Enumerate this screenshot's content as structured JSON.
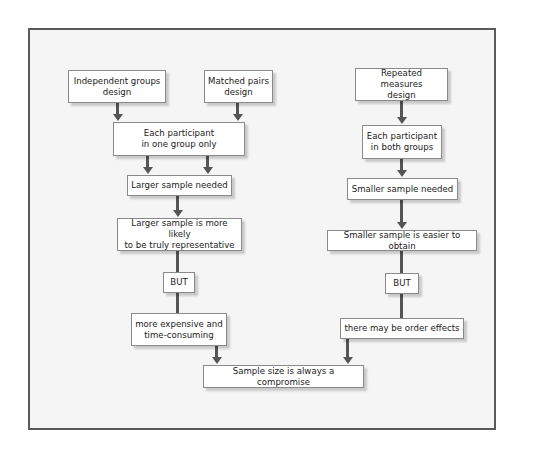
{
  "diagram": {
    "type": "flowchart",
    "title": "",
    "nodes": [
      {
        "id": "independent",
        "label": "Independent groups\ndesign"
      },
      {
        "id": "matched",
        "label": "Matched pairs\ndesign"
      },
      {
        "id": "repeated",
        "label": "Repeated measures\ndesign"
      },
      {
        "id": "one_group",
        "label": "Each participant\nin one group only"
      },
      {
        "id": "both_groups",
        "label": "Each participant\nin both groups"
      },
      {
        "id": "larger_needed",
        "label": "Larger sample needed"
      },
      {
        "id": "smaller_needed",
        "label": "Smaller sample needed"
      },
      {
        "id": "larger_representative",
        "label": "Larger sample is more likely\nto be truly representative"
      },
      {
        "id": "smaller_easier",
        "label": "Smaller sample is easier to obtain"
      },
      {
        "id": "but_left",
        "label": "BUT"
      },
      {
        "id": "but_right",
        "label": "BUT"
      },
      {
        "id": "expensive",
        "label": "more expensive and\ntime-consuming"
      },
      {
        "id": "order_effects",
        "label": "there may be order effects"
      },
      {
        "id": "compromise",
        "label": "Sample size is always a compromise"
      }
    ],
    "edges": [
      {
        "from": "independent",
        "to": "one_group"
      },
      {
        "from": "matched",
        "to": "one_group"
      },
      {
        "from": "one_group",
        "to": "larger_needed"
      },
      {
        "from": "larger_needed",
        "to": "larger_representative"
      },
      {
        "from": "larger_representative",
        "to": "but_left"
      },
      {
        "from": "but_left",
        "to": "expensive"
      },
      {
        "from": "expensive",
        "to": "compromise"
      },
      {
        "from": "repeated",
        "to": "both_groups"
      },
      {
        "from": "both_groups",
        "to": "smaller_needed"
      },
      {
        "from": "smaller_needed",
        "to": "smaller_easier"
      },
      {
        "from": "smaller_easier",
        "to": "but_right"
      },
      {
        "from": "but_right",
        "to": "order_effects"
      },
      {
        "from": "order_effects",
        "to": "compromise"
      }
    ]
  },
  "colors": {
    "frame_border": "#5a5a5a",
    "frame_background": "#f5f5f5",
    "box_background": "#ffffff",
    "box_border": "#8a8a8a",
    "arrow": "#555555"
  }
}
